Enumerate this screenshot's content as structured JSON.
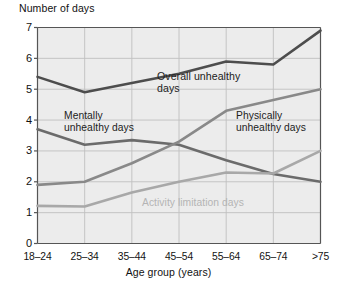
{
  "chart_data": {
    "type": "line",
    "title": "",
    "xlabel": "Age group (years)",
    "ylabel": "Number of days",
    "categories": [
      "18–24",
      "25–34",
      "35–44",
      "45–54",
      "55–64",
      "65–74",
      ">75"
    ],
    "yticks": [
      "0",
      "1",
      "2",
      "3",
      "4",
      "5",
      "6",
      "7"
    ],
    "ylim": [
      0,
      7
    ],
    "grid": true,
    "legend_position": "inline-annotations",
    "series": [
      {
        "name": "Overall unhealthy days",
        "color": "#4d4d4d",
        "values": [
          5.4,
          4.9,
          5.2,
          5.5,
          5.9,
          5.8,
          6.9
        ]
      },
      {
        "name": "Mentally unhealthy days",
        "color": "#6b6b6b",
        "values": [
          3.7,
          3.2,
          3.35,
          3.2,
          2.7,
          2.25,
          2.0
        ]
      },
      {
        "name": "Physically unhealthy days",
        "color": "#898989",
        "values": [
          1.9,
          2.0,
          2.6,
          3.3,
          4.3,
          4.65,
          5.0
        ]
      },
      {
        "name": "Activity limitation days",
        "color": "#a8a8a8",
        "values": [
          1.22,
          1.2,
          1.65,
          2.0,
          2.3,
          2.27,
          3.0
        ]
      }
    ],
    "annotations": [
      {
        "text": "Overall unhealthy\ndays",
        "series": "Overall unhealthy days"
      },
      {
        "text": "Mentally\nunhealthy days",
        "series": "Mentally unhealthy days"
      },
      {
        "text": "Physically\nunhealthy days",
        "series": "Physically unhealthy days"
      },
      {
        "text": "Activity limitation days",
        "series": "Activity limitation days"
      }
    ],
    "style": {
      "plot_background": "#ececec",
      "grid_color": "#bfbfbf",
      "axis_color": "#555555"
    }
  }
}
